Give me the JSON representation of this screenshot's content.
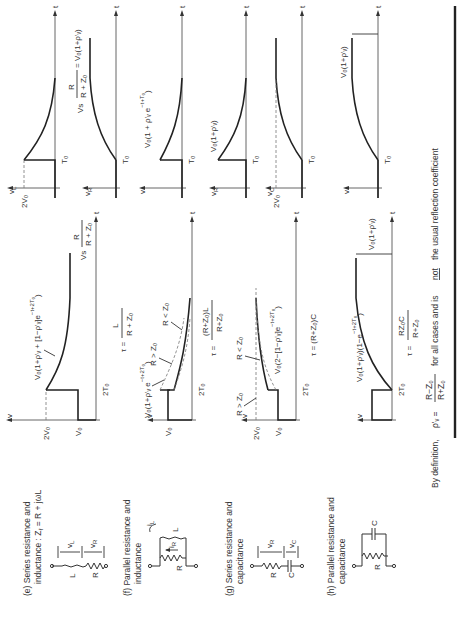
{
  "figure": {
    "rows": [
      {
        "id": "e",
        "caption_line1": "(e) Series resistance and",
        "caption_line2": "inductance : Z",
        "caption_line2_sub": "ℓ",
        "caption_line2_tail": " = R + jωL",
        "components": [
          "L",
          "R"
        ],
        "component_voltages": [
          "v_L",
          "v_R"
        ],
        "source_plot": {
          "y_axis": "v",
          "levels": [
            "2V₀",
            "V₀"
          ],
          "time_mark": "2T₀",
          "t_axis": "t",
          "curve_label": "V₀(1+ρ'ᵥ + [1−ρ'ᵥ]e^(−(t+2T₀)/τ))",
          "final_label": "Vs R/(R+Z₀)",
          "tau": "τ = L/(R+Z₀)"
        },
        "component_plots": [
          {
            "y_axis": "v_L",
            "level": "2V₀",
            "time_mark": "T₀",
            "t_axis": "t",
            "shape": "decay"
          },
          {
            "y_axis": "v_R",
            "time_mark": "T₀",
            "t_axis": "t",
            "shape": "rise",
            "final_label": "Vs R/(R+Z₀) = V₀(1+ρ'ᵥ)"
          }
        ]
      },
      {
        "id": "f",
        "caption_line1": "(f) Parallel resistance and",
        "caption_line2": "inductance",
        "components": [
          "R",
          "L"
        ],
        "branch_currents": [
          "i_R",
          "i_L"
        ],
        "source_plot": {
          "y_axis": "v",
          "levels": [
            "V₀"
          ],
          "time_mark": "2T₀",
          "t_axis": "t",
          "curve_label": "V₀(1+ρ'ᵥ e^(−(t+2T₀)/τ))",
          "branch_labels": [
            "R > Z₀",
            "R < Z₀"
          ],
          "tau": "τ = (R+Z₀)L / (R+Z₀)"
        },
        "component_plots": [
          {
            "y_axis": "v",
            "time_mark": "T₀",
            "t_axis": "t",
            "shape": "decay",
            "curve_label": "V₀(1+ρ'ᵥ e^(−(t+T₀)/τ))"
          }
        ]
      },
      {
        "id": "g",
        "caption_line1": "(g) Series resistance and",
        "caption_line2": "capacitance",
        "components": [
          "R",
          "C"
        ],
        "component_voltages": [
          "v_R",
          "v_C"
        ],
        "source_plot": {
          "y_axis": "v",
          "levels": [
            "2V₀",
            "V₀"
          ],
          "time_mark": "2T₀",
          "t_axis": "t",
          "branch_labels": [
            "R > Z₀",
            "R < Z₀"
          ],
          "curve_label": "V₀(2−[1−ρ'ᵥ]e^(−(t+2T₀)/τ))",
          "tau": "τ = (R+Z₀)C"
        },
        "component_plots": [
          {
            "y_axis": "v_R",
            "time_mark": "T₀",
            "t_axis": "t",
            "shape": "decay",
            "curve_label": "V₀(1+ρ'ᵥ)"
          },
          {
            "y_axis": "v_C",
            "level": "2V₀",
            "time_mark": "T₀",
            "t_axis": "t",
            "shape": "rise"
          }
        ]
      },
      {
        "id": "h",
        "caption_line1": "(h) Parallel resistance and",
        "caption_line2": "capacitance",
        "components": [
          "R",
          "C"
        ],
        "source_plot": {
          "y_axis": "v",
          "time_mark": "2T₀",
          "t_axis": "t",
          "curve_label": "V₀(1+ρ'ᵥ)(1−e^(−(t+2T₀)/τ))",
          "final_label": "V₀(1+ρ'ᵥ)",
          "tau": "τ = RZ₀C / (R+Z₀)"
        },
        "component_plots": [
          {
            "y_axis": "v",
            "time_mark": "T₀",
            "t_axis": "t",
            "shape": "rise",
            "final_label": "V₀(1+ρ'ᵥ)"
          }
        ]
      }
    ],
    "footer": {
      "prefix": "By definition,",
      "symbol": "ρ'ᵥ =",
      "fraction_num": "R−Z₀",
      "fraction_den": "R+Z₀",
      "middle": "for all cases and is",
      "emph": "not",
      "suffix": "the usual reflection coefficient"
    }
  },
  "labels": {
    "t": "t",
    "v": "v",
    "vL": "v",
    "vL_sub": "L",
    "vR": "v",
    "vR_sub": "R",
    "vC": "v",
    "vC_sub": "C",
    "iR": "i",
    "iR_sub": "R",
    "iL": "i",
    "iL_sub": "L",
    "L": "L",
    "R": "R",
    "C": "C",
    "V0": "V₀",
    "twoV0": "2V₀",
    "T0": "T₀",
    "twoT0": "2T₀",
    "RgtZ0": "R > Z₀",
    "RltZ0": "R < Z₀",
    "e_curve": "V₀(1+ρ'ᵥ + [1−ρ'ᵥ]e",
    "e_exp": "−t+2T₀",
    "e_exp_den": "τ",
    "e_final_num": "R",
    "e_final_pre": "Vs",
    "e_final_den": "R + Z₀",
    "e_tau_pre": "τ =",
    "e_tau_num": "L",
    "e_tau_den": "R + Z₀",
    "f_curve": "V₀(1+ρ'ᵥ e",
    "f_exp": "−t+2T₀",
    "f_tau_pre": "τ =",
    "f_tau_num": "(R+Z₀)L",
    "f_tau_den": "R+Z₀",
    "g_curve": "V₀(2−[1−ρ'ᵥ]e",
    "g_exp": "−t+2T₀",
    "g_tau": "τ = (R+Z₀)C",
    "h_curve": "V₀(1+ρ'ᵥ)(1−e",
    "h_exp": "−t+2T₀",
    "h_final": "V₀(1+ρ'ᵥ)",
    "h_tau_pre": "τ =",
    "h_tau_num": "RZ₀C",
    "h_tau_den": "R+Z₀",
    "eR_final": "Vs",
    "eR_final_num": "R",
    "eR_final_den": "R + Z₀",
    "eR_final_tail": "= V₀(1+ρ'ᵥ)",
    "f2_curve": "V₀(1 + ρ'ᵥ e",
    "f2_exp": "−t+T₀",
    "g2_label": "V₀(1+ρ'ᵥ)",
    "h2_label": "V₀(1+ρ'ᵥ)",
    "tau_sym": "τ"
  }
}
